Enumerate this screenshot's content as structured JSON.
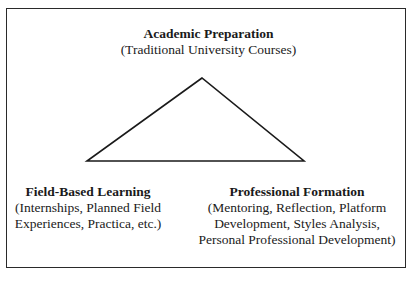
{
  "diagram": {
    "type": "triangle-model",
    "vertices": {
      "top": {
        "title": "Academic Preparation",
        "description": [
          "(Traditional University Courses)"
        ]
      },
      "bottom_left": {
        "title": "Field-Based Learning",
        "description": [
          "(Internships, Planned Field",
          "Experiences, Practica, etc.)"
        ]
      },
      "bottom_right": {
        "title": "Professional Formation",
        "description": [
          "(Mentoring, Reflection, Platform",
          "Development, Styles Analysis,",
          "Personal Professional Development)"
        ]
      }
    },
    "colors": {
      "line": "#1a1a1a",
      "border": "#2a2a2a",
      "background": "#ffffff"
    }
  }
}
